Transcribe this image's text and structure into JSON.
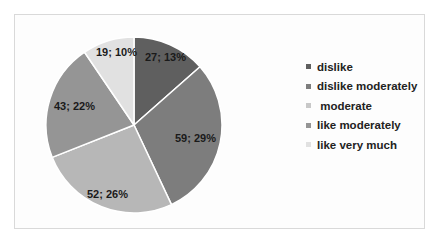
{
  "chart_data": {
    "type": "pie",
    "title": "",
    "categories": [
      "dislike",
      "dislike moderately",
      "moderate",
      "like moderately",
      "like very much"
    ],
    "values": [
      27,
      59,
      52,
      43,
      19
    ],
    "percentages": [
      13,
      29,
      26,
      22,
      10
    ],
    "data_labels": [
      "27; 13%",
      "59; 29%",
      "52; 26%",
      "43; 22%",
      "19; 10%"
    ],
    "colors": [
      "#5f5f5f",
      "#7d7d7d",
      "#b7b7b7",
      "#959595",
      "#e1e1e1"
    ],
    "legend_position": "right",
    "start_angle_deg": 0,
    "direction": "clockwise"
  },
  "legend": {
    "items": [
      {
        "label": "dislike",
        "color": "#5f5f5f"
      },
      {
        "label": "dislike moderately",
        "color": "#7d7d7d"
      },
      {
        "label": " moderate",
        "color": "#c8c8c8"
      },
      {
        "label": "like moderately",
        "color": "#959595"
      },
      {
        "label": "like very much",
        "color": "#e1e1e1"
      }
    ]
  }
}
